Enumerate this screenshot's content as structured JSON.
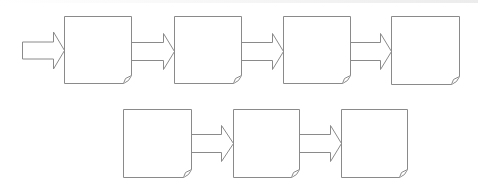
{
  "diagram": {
    "type": "process-flow",
    "stroke_color": "#8a8a8a",
    "fill_color": "#ffffff",
    "background": "#ffffff",
    "nodes": [
      {
        "id": "box-1",
        "shape": "folded-note",
        "x": 64,
        "y": 16,
        "w": 67,
        "h": 67,
        "label": ""
      },
      {
        "id": "box-2",
        "shape": "folded-note",
        "x": 174,
        "y": 16,
        "w": 67,
        "h": 67,
        "label": ""
      },
      {
        "id": "box-3",
        "shape": "folded-note",
        "x": 283,
        "y": 16,
        "w": 67,
        "h": 67,
        "label": ""
      },
      {
        "id": "box-4",
        "shape": "folded-note",
        "x": 391,
        "y": 16,
        "w": 68,
        "h": 68,
        "label": ""
      },
      {
        "id": "box-5",
        "shape": "folded-note",
        "x": 123,
        "y": 109,
        "w": 68,
        "h": 68,
        "label": ""
      },
      {
        "id": "box-6",
        "shape": "folded-note",
        "x": 233,
        "y": 109,
        "w": 66,
        "h": 68,
        "label": ""
      },
      {
        "id": "box-7",
        "shape": "folded-note",
        "x": 341,
        "y": 109,
        "w": 66,
        "h": 68,
        "label": ""
      }
    ],
    "arrows": [
      {
        "id": "arrow-in",
        "from": null,
        "to": "box-1",
        "x1": 22,
        "x2": 64,
        "cy": 50,
        "shaft_h": 17,
        "head_h": 37,
        "head_len": 11
      },
      {
        "id": "arrow-1-2",
        "from": "box-1",
        "to": "box-2",
        "x1": 131,
        "x2": 174,
        "cy": 51,
        "shaft_h": 18,
        "head_h": 36,
        "head_len": 11
      },
      {
        "id": "arrow-2-3",
        "from": "box-2",
        "to": "box-3",
        "x1": 241,
        "x2": 283,
        "cy": 51,
        "shaft_h": 18,
        "head_h": 36,
        "head_len": 11
      },
      {
        "id": "arrow-3-4",
        "from": "box-3",
        "to": "box-4",
        "x1": 350,
        "x2": 391,
        "cy": 51,
        "shaft_h": 18,
        "head_h": 36,
        "head_len": 11
      },
      {
        "id": "arrow-5-6",
        "from": "box-5",
        "to": "box-6",
        "x1": 191,
        "x2": 233,
        "cy": 143,
        "shaft_h": 18,
        "head_h": 36,
        "head_len": 12
      },
      {
        "id": "arrow-6-7",
        "from": "box-6",
        "to": "box-7",
        "x1": 299,
        "x2": 341,
        "cy": 143,
        "shaft_h": 18,
        "head_h": 36,
        "head_len": 11
      }
    ]
  }
}
